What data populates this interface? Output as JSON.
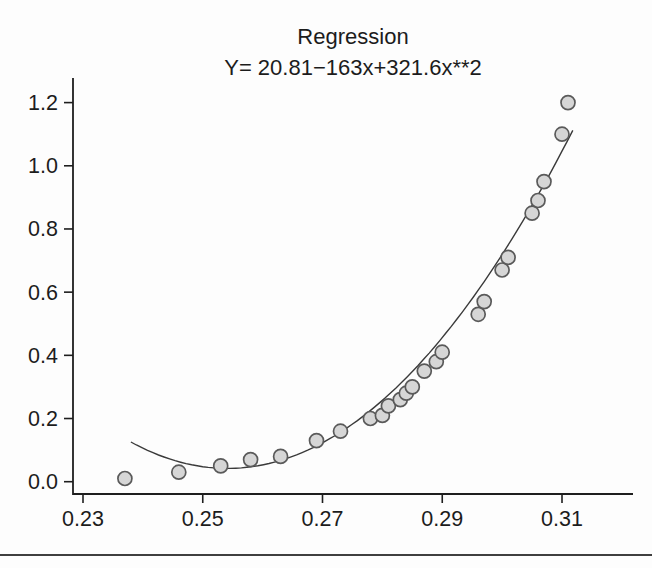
{
  "page": {
    "title": "Regression",
    "subtitle": "Y= 20.81−163x+321.6x**2"
  },
  "chart_data": {
    "type": "scatter",
    "title": "Regression",
    "subtitle": "Y= 20.81−163x+321.6x**2",
    "xlabel": "",
    "ylabel": "",
    "xlim": [
      0.222,
      0.322
    ],
    "ylim": [
      0.0,
      1.28
    ],
    "grid": false,
    "legend": null,
    "x_ticks": [
      {
        "value": 0.23,
        "label": "0.23"
      },
      {
        "value": 0.25,
        "label": "0.25"
      },
      {
        "value": 0.27,
        "label": "0.27"
      },
      {
        "value": 0.29,
        "label": "0.29"
      },
      {
        "value": 0.31,
        "label": "0.31"
      }
    ],
    "y_ticks": [
      {
        "value": 0.0,
        "label": "0.0"
      },
      {
        "value": 0.2,
        "label": "0.2"
      },
      {
        "value": 0.4,
        "label": "0.4"
      },
      {
        "value": 0.6,
        "label": "0.6"
      },
      {
        "value": 0.8,
        "label": "0.8"
      },
      {
        "value": 1.0,
        "label": "1.0"
      },
      {
        "value": 1.2,
        "label": "1.2"
      }
    ],
    "points": [
      [
        0.237,
        0.01
      ],
      [
        0.246,
        0.03
      ],
      [
        0.253,
        0.05
      ],
      [
        0.258,
        0.07
      ],
      [
        0.263,
        0.08
      ],
      [
        0.269,
        0.13
      ],
      [
        0.273,
        0.16
      ],
      [
        0.278,
        0.2
      ],
      [
        0.28,
        0.21
      ],
      [
        0.281,
        0.24
      ],
      [
        0.283,
        0.26
      ],
      [
        0.284,
        0.28
      ],
      [
        0.285,
        0.3
      ],
      [
        0.287,
        0.35
      ],
      [
        0.289,
        0.38
      ],
      [
        0.29,
        0.41
      ],
      [
        0.296,
        0.53
      ],
      [
        0.297,
        0.57
      ],
      [
        0.3,
        0.67
      ],
      [
        0.301,
        0.71
      ],
      [
        0.305,
        0.85
      ],
      [
        0.306,
        0.89
      ],
      [
        0.307,
        0.95
      ],
      [
        0.31,
        1.1
      ],
      [
        0.311,
        1.2
      ]
    ],
    "fit_curve": {
      "equation": "Y= 20.81−163x+321.6x**2",
      "a": 321.6,
      "b": -163.45,
      "c": 20.81,
      "x_start": 0.238,
      "x_end": 0.3118
    },
    "style": {
      "axis_color": "#1e1e1e",
      "text_color": "#1c1c1c",
      "curve_color": "#3a3a3a",
      "point_fill": "#d6d6d6",
      "point_stroke": "#5a5a5a",
      "rule_color": "#3f3f3f"
    }
  }
}
